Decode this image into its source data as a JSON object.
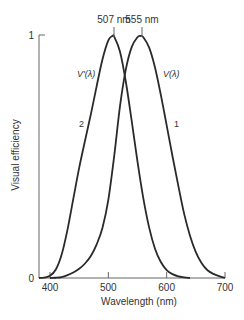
{
  "chart_data": {
    "type": "line",
    "title": "",
    "xlabel": "Wavelength (nm)",
    "ylabel": "Visual efficiency",
    "xlim": [
      381,
      700
    ],
    "ylim": [
      0,
      1
    ],
    "xticks": [
      400,
      500,
      600,
      700
    ],
    "xtick_labels": [
      "400",
      "500",
      "600",
      "700"
    ],
    "yticks": [
      0,
      1
    ],
    "ytick_labels": [
      "0",
      "1"
    ],
    "grid": false,
    "legend": null,
    "annotations": [
      {
        "text": "507 nm",
        "x": 507,
        "y": 1.0,
        "position": "above-peak"
      },
      {
        "text": "555 nm",
        "x": 555,
        "y": 1.0,
        "position": "above-peak"
      },
      {
        "text": "V'(λ)",
        "curve": 2
      },
      {
        "text": "V(λ)",
        "curve": 1
      },
      {
        "text": "2",
        "curve": 2
      },
      {
        "text": "1",
        "curve": 1
      }
    ],
    "series": [
      {
        "name": "V'(λ)",
        "id": "2",
        "description": "Scotopic (rod) luminous efficiency, peak 507 nm",
        "x": [
          381,
          390,
          400,
          410,
          420,
          430,
          440,
          450,
          460,
          470,
          480,
          490,
          500,
          507,
          510,
          520,
          530,
          540,
          550,
          560,
          570,
          580,
          590,
          600,
          610,
          620,
          630,
          640
        ],
        "values": [
          0.0,
          0.002,
          0.009,
          0.035,
          0.097,
          0.2,
          0.328,
          0.455,
          0.567,
          0.676,
          0.793,
          0.904,
          0.982,
          1.0,
          0.997,
          0.935,
          0.811,
          0.65,
          0.481,
          0.329,
          0.208,
          0.121,
          0.066,
          0.033,
          0.016,
          0.007,
          0.003,
          0.0
        ]
      },
      {
        "name": "V(λ)",
        "id": "1",
        "description": "Photopic (cone) luminous efficiency, peak 555 nm",
        "x": [
          400,
          410,
          420,
          430,
          440,
          450,
          460,
          470,
          480,
          490,
          500,
          510,
          520,
          530,
          540,
          550,
          555,
          560,
          570,
          580,
          590,
          600,
          610,
          620,
          630,
          640,
          650,
          660,
          670,
          680,
          690,
          700
        ],
        "values": [
          0.0,
          0.001,
          0.004,
          0.012,
          0.023,
          0.038,
          0.06,
          0.091,
          0.139,
          0.208,
          0.323,
          0.503,
          0.71,
          0.862,
          0.954,
          0.995,
          1.0,
          0.995,
          0.952,
          0.87,
          0.757,
          0.631,
          0.503,
          0.381,
          0.265,
          0.175,
          0.107,
          0.061,
          0.032,
          0.017,
          0.008,
          0.0
        ]
      }
    ]
  },
  "labels": {
    "peak_left": "507 nm",
    "peak_right": "555 nm",
    "curve_left_name": "V'(λ)",
    "curve_right_name": "V(λ)",
    "curve_left_number": "2",
    "curve_right_number": "1",
    "ytick_top": "1",
    "ytick_bottom": "0",
    "xticks": [
      "400",
      "500",
      "600",
      "700"
    ],
    "xlabel": "Wavelength (nm)",
    "ylabel": "Visual efficiency"
  }
}
